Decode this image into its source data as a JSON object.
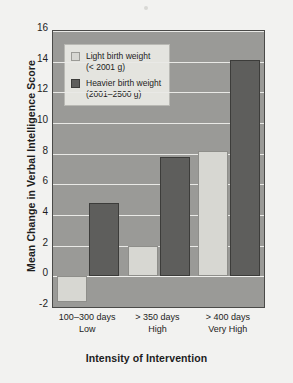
{
  "chart_data": {
    "type": "bar",
    "title": "",
    "xlabel": "Intensity of Intervention",
    "ylabel": "Mean Change in Verbal Intelligence Score",
    "categories": [
      "100–300 days\nLow",
      "> 350 days\nHigh",
      "> 400 days\nVery High"
    ],
    "category_lines": [
      {
        "line1": "100–300 days",
        "line2": "Low"
      },
      {
        "line1": "> 350 days",
        "line2": "High"
      },
      {
        "line1": "> 400 days",
        "line2": "Very High"
      }
    ],
    "series": [
      {
        "name": "Light birth weight (< 2001 g)",
        "values": [
          -1.7,
          2.0,
          8.2
        ]
      },
      {
        "name": "Heavier birth weight (2001–2500 g)",
        "values": [
          4.8,
          7.8,
          14.1
        ]
      }
    ],
    "ylim": [
      -2,
      16
    ],
    "yticks": [
      -2,
      0,
      2,
      4,
      6,
      8,
      10,
      12,
      14,
      16
    ],
    "ytick_labels": [
      "-2",
      "0",
      "2",
      "4",
      "6",
      "8",
      "10",
      "12",
      "14",
      "16"
    ],
    "grid": true,
    "legend_position": "top-left",
    "colors": {
      "light_series": "#d7d7d2",
      "dark_series": "#5e5e5c",
      "plot_background": "#9a9a97",
      "gridline": "#e9e9e6",
      "figure_background": "#f2f2f0",
      "text": "#1d1d1d"
    }
  },
  "legend": {
    "items": [
      {
        "line1": "Light birth weight",
        "line2": "(< 2001 g)",
        "swatch": "light"
      },
      {
        "line1": "Heavier birth weight",
        "line2": "(2001–2500 g)",
        "swatch": "dark"
      }
    ]
  }
}
